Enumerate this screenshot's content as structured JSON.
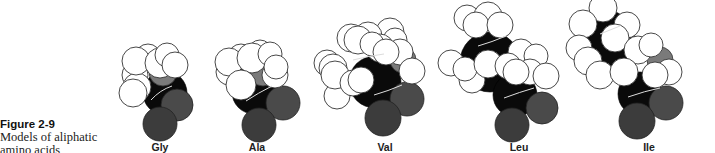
{
  "figure": {
    "label": "Figure 2-9",
    "caption_line1": "Models of aliphatic",
    "caption_line2": "amino acids"
  },
  "models": [
    {
      "name": "Gly",
      "label": "Gly"
    },
    {
      "name": "Ala",
      "label": "Ala"
    },
    {
      "name": "Val",
      "label": "Val"
    },
    {
      "name": "Leu",
      "label": "Leu"
    },
    {
      "name": "Ile",
      "label": "Ile"
    }
  ],
  "colors": {
    "hydrogen": "#ffffff",
    "carbon": "#0a0a0a",
    "oxygen": "#4a4a4a",
    "nitrogen": "#7a7a7a"
  }
}
